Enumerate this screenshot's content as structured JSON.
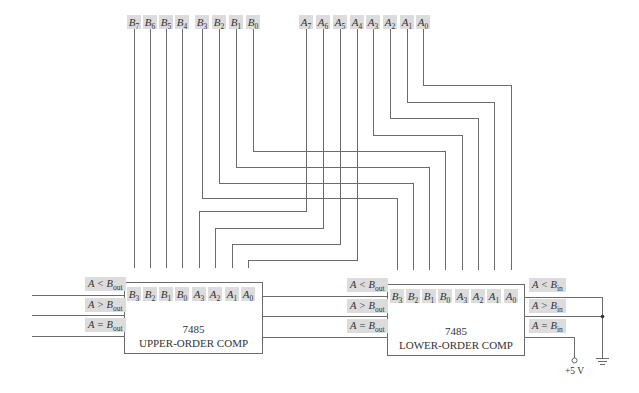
{
  "inputs_top": {
    "B": [
      {
        "letter": "B",
        "sub": "7",
        "x": 134
      },
      {
        "letter": "B",
        "sub": "6",
        "x": 150
      },
      {
        "letter": "B",
        "sub": "5",
        "x": 166
      },
      {
        "letter": "B",
        "sub": "4",
        "x": 182
      },
      {
        "letter": "B",
        "sub": "3",
        "x": 202
      },
      {
        "letter": "B",
        "sub": "2",
        "x": 219
      },
      {
        "letter": "B",
        "sub": "1",
        "x": 236
      },
      {
        "letter": "B",
        "sub": "0",
        "x": 253
      }
    ],
    "A": [
      {
        "letter": "A",
        "sub": "7",
        "x": 306
      },
      {
        "letter": "A",
        "sub": "6",
        "x": 323
      },
      {
        "letter": "A",
        "sub": "5",
        "x": 340
      },
      {
        "letter": "A",
        "sub": "4",
        "x": 357
      },
      {
        "letter": "A",
        "sub": "3",
        "x": 373
      },
      {
        "letter": "A",
        "sub": "2",
        "x": 390
      },
      {
        "letter": "A",
        "sub": "1",
        "x": 407
      },
      {
        "letter": "A",
        "sub": "0",
        "x": 423
      }
    ]
  },
  "upper_comp": {
    "part": "7485",
    "name": "UPPER-ORDER COMP",
    "pins": [
      {
        "letter": "B",
        "sub": "3"
      },
      {
        "letter": "B",
        "sub": "2"
      },
      {
        "letter": "B",
        "sub": "1"
      },
      {
        "letter": "B",
        "sub": "0"
      },
      {
        "letter": "A",
        "sub": "3"
      },
      {
        "letter": "A",
        "sub": "2"
      },
      {
        "letter": "A",
        "sub": "1"
      },
      {
        "letter": "A",
        "sub": "0"
      }
    ],
    "outputs": [
      {
        "lhs": "A",
        "op": "<",
        "rhs": "B",
        "sub": "out"
      },
      {
        "lhs": "A",
        "op": ">",
        "rhs": "B",
        "sub": "out"
      },
      {
        "lhs": "A",
        "op": "=",
        "rhs": "B",
        "sub": "out"
      }
    ]
  },
  "lower_comp": {
    "part": "7485",
    "name": "LOWER-ORDER COMP",
    "pins": [
      {
        "letter": "B",
        "sub": "3"
      },
      {
        "letter": "B",
        "sub": "2"
      },
      {
        "letter": "B",
        "sub": "1"
      },
      {
        "letter": "B",
        "sub": "0"
      },
      {
        "letter": "A",
        "sub": "3"
      },
      {
        "letter": "A",
        "sub": "2"
      },
      {
        "letter": "A",
        "sub": "1"
      },
      {
        "letter": "A",
        "sub": "0"
      }
    ],
    "outputs": [
      {
        "lhs": "A",
        "op": "<",
        "rhs": "B",
        "sub": "out"
      },
      {
        "lhs": "A",
        "op": ">",
        "rhs": "B",
        "sub": "out"
      },
      {
        "lhs": "A",
        "op": "=",
        "rhs": "B",
        "sub": "out"
      }
    ],
    "cascade_inputs": [
      {
        "lhs": "A",
        "op": "<",
        "rhs": "B",
        "sub": "in"
      },
      {
        "lhs": "A",
        "op": ">",
        "rhs": "B",
        "sub": "in"
      },
      {
        "lhs": "A",
        "op": "=",
        "rhs": "B",
        "sub": "in"
      }
    ]
  },
  "supply": {
    "label": "+5 V"
  },
  "colors": {
    "wire": "#6b6b6b",
    "label_bg": "#dcdcdc",
    "text": "#333333"
  }
}
